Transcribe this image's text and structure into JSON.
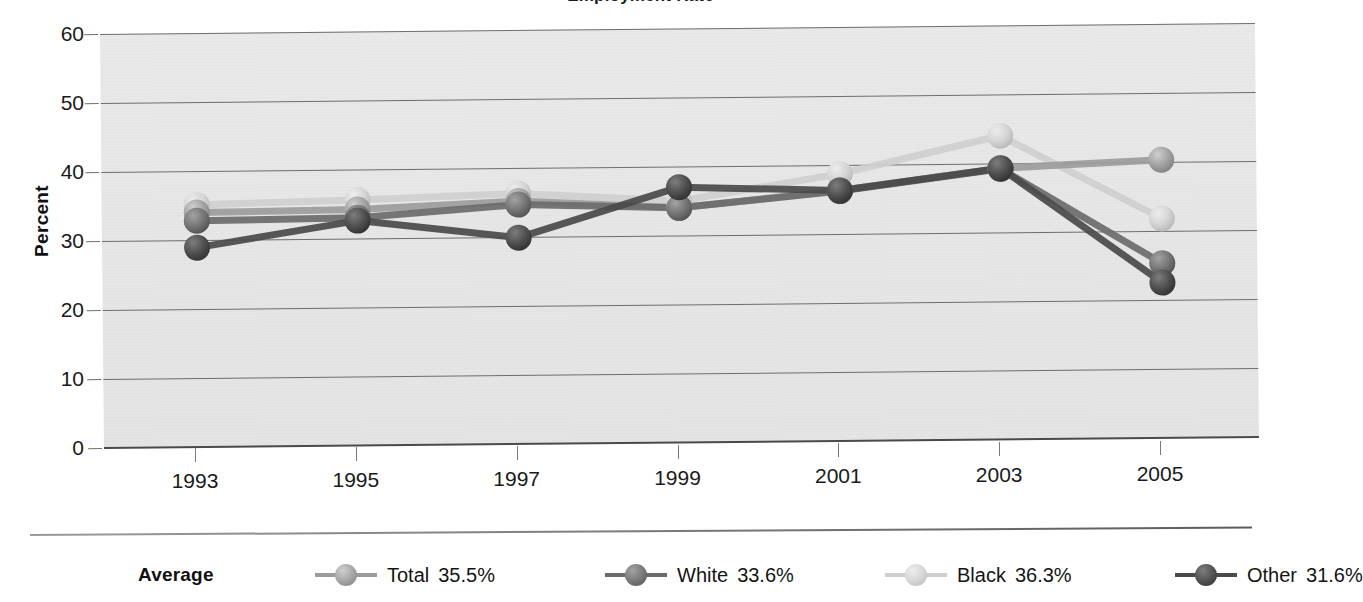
{
  "chart_data": {
    "type": "line",
    "title": "Employment Rate",
    "xlabel": "",
    "ylabel": "Percent",
    "categories": [
      "1993",
      "1995",
      "1997",
      "1999",
      "2001",
      "2003",
      "2005"
    ],
    "x": [
      1993,
      1995,
      1997,
      1999,
      2001,
      2003,
      2005
    ],
    "ylim": [
      0,
      60
    ],
    "ytick_labels": [
      "0",
      "10",
      "20",
      "30",
      "40",
      "50",
      "60"
    ],
    "ytick_values": [
      0,
      10,
      20,
      30,
      40,
      50,
      60
    ],
    "grid": true,
    "legend_position": "bottom",
    "legend_title": "Average",
    "series": [
      {
        "name": "Total",
        "average_label": "35.5%",
        "color": "#9c9c9c",
        "values": [
          34.0,
          34.2,
          35.2,
          34.0,
          36.3,
          39.3,
          40.3
        ]
      },
      {
        "name": "White",
        "average_label": "33.6%",
        "color": "#6b6b6b",
        "values": [
          32.8,
          33.0,
          34.7,
          34.0,
          36.2,
          39.2,
          25.3
        ]
      },
      {
        "name": "Black",
        "average_label": "36.3%",
        "color": "#cfcfcf",
        "values": [
          35.1,
          35.6,
          36.3,
          35.0,
          38.7,
          44.0,
          31.8
        ]
      },
      {
        "name": "Other",
        "average_label": "31.6%",
        "color": "#4a4a4a",
        "values": [
          28.9,
          32.6,
          29.9,
          37.0,
          36.3,
          39.3,
          22.5
        ]
      }
    ]
  },
  "axes": {
    "y_title": "Percent"
  },
  "legend": {
    "title": "Average",
    "items": [
      {
        "label": "Total",
        "value": "35.5%"
      },
      {
        "label": "White",
        "value": "33.6%"
      },
      {
        "label": "Black",
        "value": "36.3%"
      },
      {
        "label": "Other",
        "value": "31.6%"
      }
    ]
  },
  "colors": {
    "plot_background": "#e7e7e7",
    "gridline": "#6e6e6e",
    "axis_text": "#1a1a1a",
    "page_background": "#ffffff",
    "total": "#9c9c9c",
    "white": "#6b6b6b",
    "black": "#cfcfcf",
    "other": "#4a4a4a"
  }
}
